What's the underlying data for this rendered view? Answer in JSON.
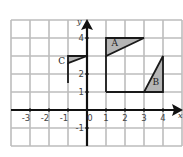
{
  "figure": {
    "type": "coordinate-grid-diagram",
    "grid": {
      "x_range": [
        -4,
        5
      ],
      "y_range": [
        -2,
        5
      ],
      "grid_color": "#bdbdbd",
      "axis_color": "#111111"
    },
    "axes": {
      "x_label": "x",
      "y_label": "y",
      "x_ticks": [
        {
          "value": -3,
          "label": "-3"
        },
        {
          "value": -2,
          "label": "-2"
        },
        {
          "value": -1,
          "label": "-1"
        },
        {
          "value": 0,
          "label": "0"
        },
        {
          "value": 1,
          "label": "1"
        },
        {
          "value": 2,
          "label": "2"
        },
        {
          "value": 3,
          "label": "3"
        },
        {
          "value": 4,
          "label": "4"
        }
      ],
      "y_ticks": [
        {
          "value": 4,
          "label": "4"
        },
        {
          "value": 2,
          "label": "2"
        },
        {
          "value": 1,
          "label": "1"
        },
        {
          "value": -1,
          "label": "-1"
        }
      ]
    },
    "shapes": [
      {
        "label": "A",
        "fill": "#b5b5b5",
        "vertices": [
          [
            1,
            4
          ],
          [
            3,
            4
          ],
          [
            1,
            3
          ]
        ],
        "label_pos": [
          1.45,
          3.7
        ]
      },
      {
        "label": "B",
        "fill": "#b5b5b5",
        "vertices": [
          [
            3,
            1
          ],
          [
            4,
            1
          ],
          [
            4,
            3
          ]
        ],
        "label_pos": [
          3.6,
          1.55
        ]
      },
      {
        "label": "C",
        "fill": "#b5b5b5",
        "vertices": [
          [
            -1,
            3
          ],
          [
            0,
            3
          ],
          [
            -1,
            2.6
          ]
        ],
        "label_pos": [
          -1.35,
          2.7
        ]
      }
    ],
    "lines": [
      {
        "from": [
          1,
          3
        ],
        "to": [
          1,
          1
        ]
      },
      {
        "from": [
          1,
          1
        ],
        "to": [
          4,
          1
        ]
      },
      {
        "from": [
          -1,
          2.6
        ],
        "to": [
          -1,
          1.5
        ]
      }
    ],
    "shape_labels": {
      "a": "A",
      "b": "B",
      "c": "C"
    }
  }
}
